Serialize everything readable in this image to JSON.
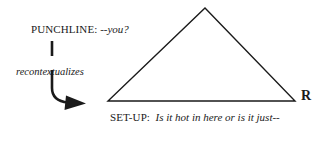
{
  "diagram": {
    "type": "annotated-triangle-diagram",
    "background_color": "#ffffff",
    "stroke_color": "#1a1a1a",
    "text_color": "#1a1a1a",
    "punchline": {
      "prefix": "PUNCHLINE:",
      "quote": "--you?"
    },
    "relation": {
      "label": "recontextualizes"
    },
    "setup": {
      "prefix": "SET-UP:",
      "quote": "Is it hot in here or is it just--"
    },
    "vertex": {
      "right_label": "R"
    },
    "triangle": {
      "apex": [
        205,
        8
      ],
      "bottom_left": [
        108,
        101
      ],
      "bottom_right": [
        295,
        101
      ],
      "stroke_width": 1.4
    },
    "arrow": {
      "shape": "vertical-line-curving-right-with-arrowhead",
      "start": [
        52,
        41
      ],
      "end": [
        85,
        103
      ],
      "stroke_width": 2.6
    }
  }
}
